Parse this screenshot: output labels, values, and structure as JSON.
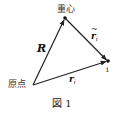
{
  "figure": {
    "caption": "図 1",
    "nodes": [
      {
        "id": "center_of_mass",
        "label": "重心",
        "x": 65,
        "y": 18
      },
      {
        "id": "point_i",
        "label": "i",
        "x": 108,
        "y": 61
      },
      {
        "id": "origin",
        "label": "原点",
        "x": 33,
        "y": 85
      }
    ],
    "vectors": [
      {
        "id": "R",
        "from": "origin",
        "to": "center_of_mass",
        "label": "R",
        "label_sub": ""
      },
      {
        "id": "r_tilde_i",
        "from": "center_of_mass",
        "to": "point_i",
        "label": "r",
        "label_sub": "i",
        "accent": "tilde"
      },
      {
        "id": "r_i",
        "from": "origin",
        "to": "point_i",
        "label": "r",
        "label_sub": "i"
      }
    ],
    "colors": {
      "line": "#222222",
      "text": "#333333",
      "background": "#ffffff"
    }
  }
}
